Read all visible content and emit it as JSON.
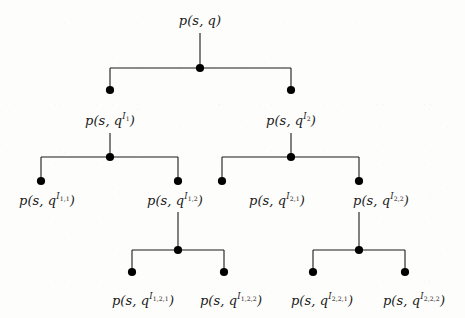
{
  "figure": {
    "type": "tree-diagram",
    "title": "",
    "background_color": "#fdfdfb",
    "line_color": "#1a1a1a",
    "node_color": "#000000",
    "text_color": "#1a1a1a"
  },
  "nodes": [
    {
      "id": "root",
      "label_base": "p(s, q",
      "label_sup": "",
      "label_sub": "",
      "label_close": ")",
      "label_plain": "p(s, q)",
      "x": 200,
      "y": 20,
      "depth": 0
    },
    {
      "id": "n1",
      "label_base": "p(s, q",
      "label_sup": "I",
      "label_sub": "1",
      "label_close": ")",
      "label_plain": "p(s, q^I_1)",
      "x": 110,
      "y": 120,
      "depth": 1
    },
    {
      "id": "n2",
      "label_base": "p(s, q",
      "label_sup": "I",
      "label_sub": "2",
      "label_close": ")",
      "label_plain": "p(s, q^I_2)",
      "x": 291,
      "y": 120,
      "depth": 1
    },
    {
      "id": "n11",
      "label_base": "p(s, q",
      "label_sup": "I",
      "label_sub": "1,1",
      "label_close": ")",
      "label_plain": "p(s, q^I_1,1)",
      "x": 47,
      "y": 200,
      "depth": 2
    },
    {
      "id": "n12",
      "label_base": "p(s, q",
      "label_sup": "I",
      "label_sub": "1,2",
      "label_close": ")",
      "label_plain": "p(s, q^I_1,2)",
      "x": 175,
      "y": 200,
      "depth": 2
    },
    {
      "id": "n21",
      "label_base": "p(s, q",
      "label_sup": "I",
      "label_sub": "2,1",
      "label_close": ")",
      "label_plain": "p(s, q^I_2,1)",
      "x": 277,
      "y": 200,
      "depth": 2
    },
    {
      "id": "n22",
      "label_base": "p(s, q",
      "label_sup": "I",
      "label_sub": "2,2",
      "label_close": ")",
      "label_plain": "p(s, q^I_2,2)",
      "x": 381,
      "y": 200,
      "depth": 2
    },
    {
      "id": "n121",
      "label_base": "p(s, q",
      "label_sup": "I",
      "label_sub": "1,2,1",
      "label_close": ")",
      "label_plain": "p(s, q^I_1,2,1)",
      "x": 143,
      "y": 300,
      "depth": 3
    },
    {
      "id": "n122",
      "label_base": "p(s, q",
      "label_sup": "I",
      "label_sub": "1,2,2",
      "label_close": ")",
      "label_plain": "p(s, q^I_1,2,2)",
      "x": 231,
      "y": 300,
      "depth": 3
    },
    {
      "id": "n221",
      "label_base": "p(s, q",
      "label_sup": "I",
      "label_sub": "2,2,1",
      "label_close": ")",
      "label_plain": "p(s, q^I_2,2,1)",
      "x": 322,
      "y": 300,
      "depth": 3
    },
    {
      "id": "n222",
      "label_base": "p(s, q",
      "label_sup": "I",
      "label_sub": "2,2,2",
      "label_close": ")",
      "label_plain": "p(s, q^I_2,2,2)",
      "x": 414,
      "y": 300,
      "depth": 3
    }
  ],
  "dots": [
    {
      "id": "dot-root-junction",
      "x": 200,
      "y": 68
    },
    {
      "id": "dot-n1",
      "x": 110,
      "y": 90
    },
    {
      "id": "dot-n2",
      "x": 291,
      "y": 90
    },
    {
      "id": "dot-n1-junction",
      "x": 110,
      "y": 157
    },
    {
      "id": "dot-n2-junction",
      "x": 291,
      "y": 157
    },
    {
      "id": "dot-n11",
      "x": 41,
      "y": 181
    },
    {
      "id": "dot-n12",
      "x": 178,
      "y": 181
    },
    {
      "id": "dot-n21",
      "x": 222,
      "y": 181
    },
    {
      "id": "dot-n22",
      "x": 359,
      "y": 181
    },
    {
      "id": "dot-n12-junction",
      "x": 178,
      "y": 250
    },
    {
      "id": "dot-n22-junction",
      "x": 359,
      "y": 250
    },
    {
      "id": "dot-n121",
      "x": 132,
      "y": 272
    },
    {
      "id": "dot-n122",
      "x": 224,
      "y": 272
    },
    {
      "id": "dot-n221",
      "x": 313,
      "y": 272
    },
    {
      "id": "dot-n222",
      "x": 405,
      "y": 272
    }
  ],
  "edges": [
    {
      "id": "stem-root",
      "x1": 200,
      "y1": 33,
      "x2": 200,
      "y2": 68
    },
    {
      "id": "bar-root",
      "x1": 110,
      "y1": 68,
      "x2": 291,
      "y2": 68
    },
    {
      "id": "drop-n1",
      "x1": 110,
      "y1": 68,
      "x2": 110,
      "y2": 90
    },
    {
      "id": "drop-n2",
      "x1": 291,
      "y1": 68,
      "x2": 291,
      "y2": 90
    },
    {
      "id": "stem-n1",
      "x1": 110,
      "y1": 133,
      "x2": 110,
      "y2": 157
    },
    {
      "id": "bar-n1",
      "x1": 41,
      "y1": 157,
      "x2": 178,
      "y2": 157
    },
    {
      "id": "drop-n11",
      "x1": 41,
      "y1": 157,
      "x2": 41,
      "y2": 181
    },
    {
      "id": "drop-n12",
      "x1": 178,
      "y1": 157,
      "x2": 178,
      "y2": 181
    },
    {
      "id": "stem-n2",
      "x1": 291,
      "y1": 133,
      "x2": 291,
      "y2": 157
    },
    {
      "id": "bar-n2",
      "x1": 222,
      "y1": 157,
      "x2": 359,
      "y2": 157
    },
    {
      "id": "drop-n21",
      "x1": 222,
      "y1": 157,
      "x2": 222,
      "y2": 181
    },
    {
      "id": "drop-n22",
      "x1": 359,
      "y1": 157,
      "x2": 359,
      "y2": 181
    },
    {
      "id": "stem-n12",
      "x1": 178,
      "y1": 212,
      "x2": 178,
      "y2": 250
    },
    {
      "id": "bar-n12",
      "x1": 132,
      "y1": 250,
      "x2": 224,
      "y2": 250
    },
    {
      "id": "drop-n121",
      "x1": 132,
      "y1": 250,
      "x2": 132,
      "y2": 272
    },
    {
      "id": "drop-n122",
      "x1": 224,
      "y1": 250,
      "x2": 224,
      "y2": 272
    },
    {
      "id": "stem-n22",
      "x1": 359,
      "y1": 212,
      "x2": 359,
      "y2": 250
    },
    {
      "id": "bar-n22",
      "x1": 313,
      "y1": 250,
      "x2": 405,
      "y2": 250
    },
    {
      "id": "drop-n221",
      "x1": 313,
      "y1": 250,
      "x2": 313,
      "y2": 272
    },
    {
      "id": "drop-n222",
      "x1": 405,
      "y1": 250,
      "x2": 405,
      "y2": 272
    }
  ]
}
